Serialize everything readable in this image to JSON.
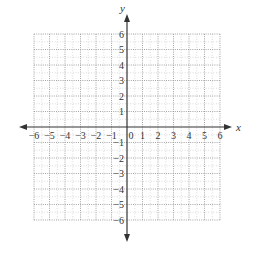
{
  "chart_data": {
    "type": "coordinate-grid",
    "title": "",
    "xlabel": "x",
    "ylabel": "y",
    "xlim": [
      -6,
      6
    ],
    "ylim": [
      -6,
      6
    ],
    "grid": true,
    "grid_style": "dotted",
    "x_ticks": [
      "-6",
      "-5",
      "-4",
      "-3",
      "-2",
      "-1",
      "0",
      "1",
      "2",
      "3",
      "4",
      "5",
      "6"
    ],
    "y_ticks": [
      "-6",
      "-5",
      "-4",
      "-3",
      "-2",
      "-1",
      "1",
      "2",
      "3",
      "4",
      "5",
      "6"
    ],
    "origin_label": "0",
    "points": []
  },
  "layout": {
    "origin_px": [
      127,
      127
    ],
    "unit_px": 15.5,
    "axis_color": "#333333",
    "grid_color": "#9a9a9a"
  }
}
